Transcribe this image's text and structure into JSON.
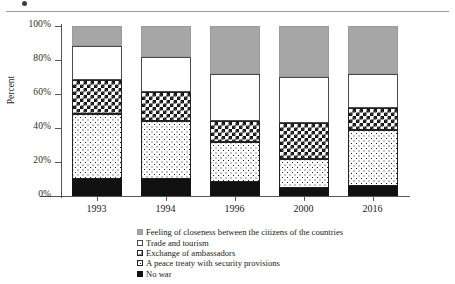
{
  "figure": {
    "y_axis_label": "Percent"
  },
  "chart_data": {
    "type": "bar",
    "subtype": "stacked-percentage-column",
    "title": "",
    "xlabel": "",
    "ylabel": "Percent",
    "ylim": [
      0,
      100
    ],
    "ytick_labels": [
      "0%",
      "20%",
      "40%",
      "60%",
      "80%",
      "100%"
    ],
    "ytick_values": [
      0,
      20,
      40,
      60,
      80,
      100
    ],
    "grid": false,
    "legend_position": "bottom",
    "categories": [
      "1993",
      "1994",
      "1996",
      "2000",
      "2016"
    ],
    "stack_order_bottom_to_top": [
      "No war",
      "A peace treaty with security provisions",
      "Exchange of ambassadors",
      "Trade and tourism",
      "Feeling of closeness between the citizens of the countries"
    ],
    "series": [
      {
        "name": "No war",
        "fill": "solid-black",
        "color": "#111111",
        "values": [
          10,
          10,
          8,
          5,
          6
        ]
      },
      {
        "name": "A peace treaty with security provisions",
        "fill": "dotted",
        "color": "#ffffff",
        "values": [
          38,
          34,
          24,
          17,
          33
        ]
      },
      {
        "name": "Exchange of ambassadors",
        "fill": "checkerboard",
        "color": "#ffffff",
        "values": [
          20,
          17,
          12,
          21,
          13
        ]
      },
      {
        "name": "Trade and tourism",
        "fill": "white",
        "color": "#ffffff",
        "values": [
          20,
          21,
          28,
          27,
          20
        ]
      },
      {
        "name": "Feeling of closeness between the citizens of the countries",
        "fill": "gray",
        "color": "#a6a6a6",
        "values": [
          12,
          18,
          28,
          30,
          28
        ]
      }
    ]
  },
  "legend": {
    "items": [
      {
        "label": "Feeling of closeness between the citizens of the countries",
        "fill": "gray"
      },
      {
        "label": "Trade and tourism",
        "fill": "white"
      },
      {
        "label": "Exchange of ambassadors",
        "fill": "checkerboard"
      },
      {
        "label": "A peace treaty with security provisions",
        "fill": "dotted"
      },
      {
        "label": "No war",
        "fill": "solid-black"
      }
    ]
  }
}
